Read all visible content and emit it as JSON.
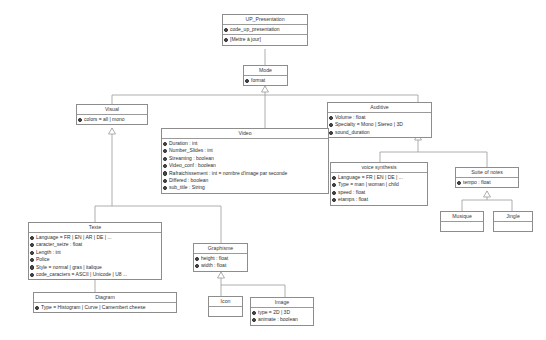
{
  "diagram": {
    "kind": "uml-class-diagram",
    "background": "#ffffff",
    "line_color": "#8d8d8d",
    "text_color": "#2e2e2e"
  },
  "classes": {
    "up_presentation": {
      "name": "UP_Presentation",
      "attributes": [
        "code_up_presentation",
        "[Mettre à jour]"
      ]
    },
    "mode": {
      "name": "Mode",
      "attributes": [
        "format"
      ]
    },
    "visual": {
      "name": "Visual",
      "attributes": [
        "colors = all | mono"
      ]
    },
    "auditive": {
      "name": "Auditive",
      "attributes": [
        "Volume : float",
        "Specialty = Mono | Stereo | 3D",
        "sound_duration"
      ]
    },
    "video": {
      "name": "Video",
      "attributes": [
        "Duration : int",
        "Number_Slides : int",
        "Streaming : boolean",
        "Video_conf : boolean",
        "Rafraichissement : int = nombre d'image par seconde",
        "Differed : boolean",
        "sub_title : String"
      ]
    },
    "voice_synthesis": {
      "name": "voice synthesis",
      "attributes": [
        "Language = FR | EN | DE | ...",
        "Type = man | woman | child",
        "speed : float",
        "etamps : float"
      ]
    },
    "suite_of_notes": {
      "name": "Suite of notes",
      "attributes": [
        "tempo : float"
      ]
    },
    "musique": {
      "name": "Musique",
      "attributes": []
    },
    "jingle": {
      "name": "Jingle",
      "attributes": []
    },
    "texte": {
      "name": "Texte",
      "attributes": [
        "Language = FR | EN | AR | DE | ...",
        "caracter_seize : float",
        "Length : int",
        "Police",
        "Style = normal | gras | italique",
        "code_caracters = ASCII | Unicode | U8 ..."
      ]
    },
    "graphisme": {
      "name": "Graphisme",
      "attributes": [
        "height : float",
        "width : float"
      ]
    },
    "diagram_class": {
      "name": "Diagram",
      "attributes": [
        "Type = Histogram | Curve | Camembert cheese"
      ]
    },
    "icon": {
      "name": "Icon",
      "attributes": []
    },
    "image": {
      "name": "Image",
      "attributes": [
        "type = 2D | 3D",
        "animate : boolean"
      ]
    }
  }
}
